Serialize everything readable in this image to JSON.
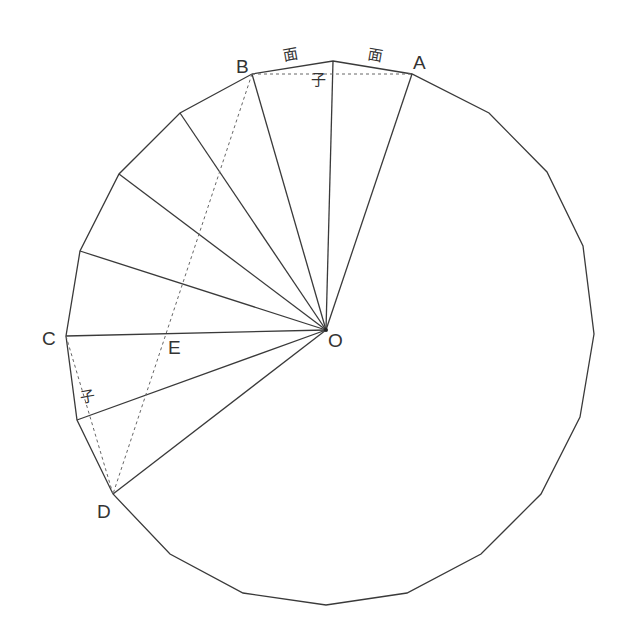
{
  "diagram": {
    "title": "",
    "center": {
      "name": "O",
      "x": 326,
      "y": 330
    },
    "polygon": [
      [
        333,
        61
      ],
      [
        412,
        74
      ],
      [
        489,
        113
      ],
      [
        547,
        172
      ],
      [
        583,
        246
      ],
      [
        594,
        334
      ],
      [
        580,
        417
      ],
      [
        541,
        494
      ],
      [
        481,
        554
      ],
      [
        407,
        593
      ],
      [
        326,
        605
      ],
      [
        243,
        593
      ],
      [
        170,
        554
      ],
      [
        113,
        494
      ],
      [
        77,
        420
      ],
      [
        66,
        336
      ],
      [
        80,
        251
      ],
      [
        119,
        174
      ],
      [
        180,
        113
      ],
      [
        252,
        74
      ]
    ],
    "rays": [
      [
        412,
        74
      ],
      [
        333,
        61
      ],
      [
        252,
        74
      ],
      [
        180,
        113
      ],
      [
        119,
        174
      ],
      [
        80,
        251
      ],
      [
        66,
        336
      ],
      [
        77,
        420
      ],
      [
        113,
        494
      ]
    ],
    "dashed": [
      [
        [
          252,
          74
        ],
        [
          412,
          74
        ]
      ],
      [
        [
          252,
          74
        ],
        [
          113,
          494
        ]
      ],
      [
        [
          66,
          336
        ],
        [
          113,
          494
        ]
      ]
    ],
    "labels": {
      "A": "A",
      "B": "B",
      "C": "C",
      "D": "D",
      "E": "E",
      "O": "O",
      "mian_left": "面",
      "mian_right": "面",
      "zi_top": "子",
      "zi_left": "子"
    },
    "colors": {
      "line": "#3a3a3a",
      "dash": "#666666",
      "text": "#333333"
    }
  }
}
